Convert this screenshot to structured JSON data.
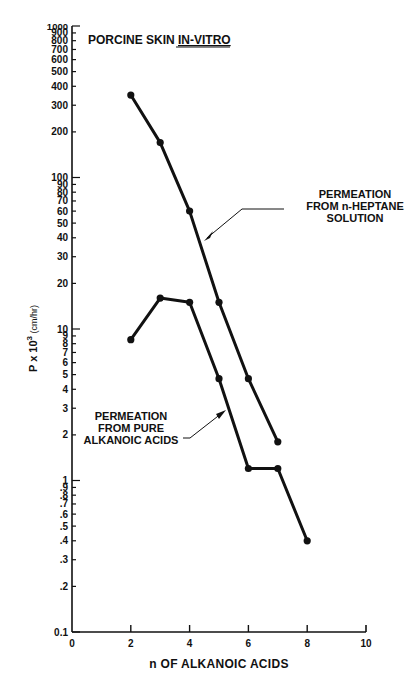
{
  "chart_data": {
    "type": "line",
    "title": "PORCINE SKIN IN-VITRO",
    "title_parts": {
      "plain": "PORCINE SKIN ",
      "underlined": "IN-VITRO"
    },
    "xlabel": "n OF ALKANOIC ACIDS",
    "ylabel": "P x 10³ (cm/hr)",
    "ylabel_parts": {
      "base": "P x 10",
      "sup": "3",
      "unit": " (cm/hr)"
    },
    "yscale": "log",
    "xlim": [
      0,
      10
    ],
    "ylim": [
      0.1,
      1000
    ],
    "grid": false,
    "x_ticks": [
      "0",
      "2",
      "4",
      "6",
      "8",
      "10"
    ],
    "y_tick_labels": [
      "1000",
      "900",
      "800",
      "700",
      "600",
      "500",
      "400",
      "300",
      "200",
      "100",
      "90",
      "80",
      "70",
      "60",
      "50",
      "40",
      "30",
      "20",
      "10",
      "9",
      "8",
      "7",
      "6",
      "5",
      "4",
      "3",
      "2",
      "1",
      ".9",
      ".8",
      ".7",
      ".6",
      ".5",
      ".4",
      ".3",
      ".2",
      "0.1"
    ],
    "series": [
      {
        "name": "PERMEATION FROM n-HEPTANE SOLUTION",
        "label_lines": [
          "PERMEATION",
          "FROM n-HEPTANE",
          "SOLUTION"
        ],
        "x": [
          2,
          3,
          4,
          5,
          6,
          7
        ],
        "values": [
          350,
          170,
          60,
          15,
          4.7,
          1.8
        ]
      },
      {
        "name": "PERMEATION FROM PURE ALKANOIC ACIDS",
        "label_lines": [
          "PERMEATION",
          "FROM PURE",
          "ALKANOIC ACIDS"
        ],
        "x": [
          2,
          3,
          4,
          5,
          6,
          7,
          8
        ],
        "values": [
          8.5,
          16,
          15,
          4.7,
          1.2,
          1.2,
          0.4
        ]
      }
    ],
    "legend_position": "annotations with arrows"
  }
}
